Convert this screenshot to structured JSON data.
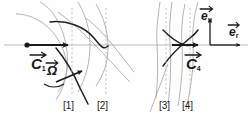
{
  "figure": {
    "type": "vector-field-diagram",
    "background_color": "#fefefe",
    "axis_color": "#b9b9b9",
    "curve_dark_color": "#1f1f1f",
    "curve_light_color": "#a9a9a9",
    "dashed_color": "#bdbdbd",
    "text_color": "#1a1a1a"
  },
  "labels": {
    "c1": {
      "symbol": "C",
      "subscript": "1",
      "vector": true
    },
    "c4": {
      "symbol": "C",
      "subscript": "4",
      "vector": true
    },
    "omega": {
      "symbol": "Ω",
      "subscript": "",
      "vector": true
    },
    "e_u": {
      "symbol": "e",
      "subscript": "u",
      "vector": true
    },
    "e_r": {
      "symbol": "e",
      "subscript": "r",
      "vector": true
    }
  },
  "brackets": [
    {
      "text": "[1]",
      "x": 67
    },
    {
      "text": "[2]",
      "x": 101
    },
    {
      "text": "[3]",
      "x": 163
    },
    {
      "text": "[4]",
      "x": 185
    }
  ],
  "station_lines": [
    {
      "name": "station-1",
      "x": 72
    },
    {
      "name": "station-2",
      "x": 106
    },
    {
      "name": "station-3",
      "x": 166
    },
    {
      "name": "station-4",
      "x": 190
    }
  ],
  "axis": {
    "name": "horizontal-axis",
    "y": 45,
    "x_start": 4,
    "x_end": 248
  },
  "origin_point": {
    "x": 27,
    "y": 45
  },
  "frame": {
    "origin_x": 210,
    "origin_y": 45,
    "up_length": 26,
    "right_length": 28
  }
}
